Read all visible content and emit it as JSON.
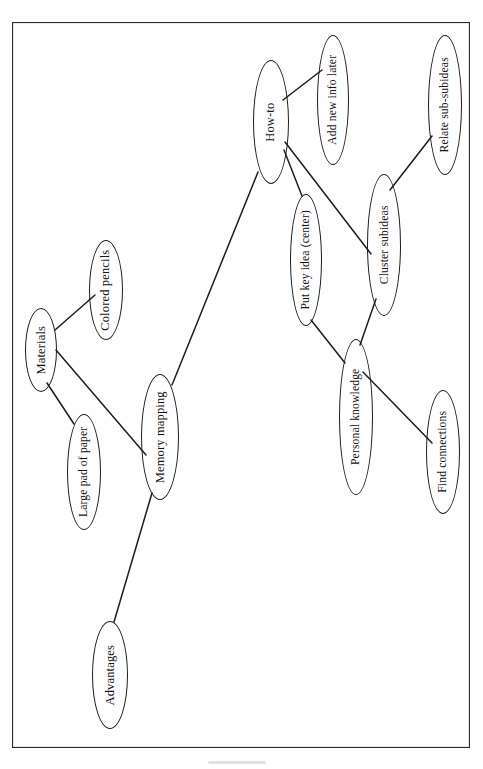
{
  "document": {
    "type": "concept-map",
    "orientation": "rotated-90-ccw",
    "frame_border_color": "#2a2a2a",
    "ink_color": "#1d1d1d",
    "background_color": "#ffffff"
  },
  "diagram": {
    "title": "Memory mapping",
    "root": "Memory mapping",
    "nodes": [
      {
        "id": "memory-mapping",
        "label": "Memory mapping",
        "role": "root",
        "cx": 160,
        "cy": 437,
        "rx": 19,
        "ry": 63
      },
      {
        "id": "materials",
        "label": "Materials",
        "role": "branch",
        "cx": 41,
        "cy": 350,
        "rx": 16,
        "ry": 42
      },
      {
        "id": "colored-pencils",
        "label": "Colored pencils",
        "role": "leaf",
        "cx": 106,
        "cy": 290,
        "rx": 17,
        "ry": 50
      },
      {
        "id": "large-pad-of-paper",
        "label": "Large pad of paper",
        "role": "leaf",
        "cx": 84,
        "cy": 472,
        "rx": 17,
        "ry": 58
      },
      {
        "id": "how-to",
        "label": "How-to",
        "role": "branch",
        "cx": 271,
        "cy": 122,
        "rx": 18,
        "ry": 62
      },
      {
        "id": "add-new-info-later",
        "label": "Add new info later",
        "role": "leaf",
        "cx": 333,
        "cy": 100,
        "rx": 16,
        "ry": 65
      },
      {
        "id": "put-key-idea-center",
        "label": "Put key idea (center)",
        "role": "leaf",
        "cx": 306,
        "cy": 260,
        "rx": 16,
        "ry": 66
      },
      {
        "id": "cluster-subideas",
        "label": "Cluster subideas",
        "role": "branch",
        "cx": 384,
        "cy": 245,
        "rx": 17,
        "ry": 71
      },
      {
        "id": "relate-sub-subideas",
        "label": "Relate sub-subideas",
        "role": "leaf",
        "cx": 445,
        "cy": 105,
        "rx": 17,
        "ry": 70
      },
      {
        "id": "personal-knowledge",
        "label": "Personal knowledge",
        "role": "branch",
        "cx": 356,
        "cy": 417,
        "rx": 17,
        "ry": 78
      },
      {
        "id": "find-connections",
        "label": "Find connections",
        "role": "leaf",
        "cx": 443,
        "cy": 452,
        "rx": 17,
        "ry": 62
      },
      {
        "id": "advantages",
        "label": "Advantages",
        "role": "branch",
        "cx": 110,
        "cy": 675,
        "rx": 18,
        "ry": 54
      }
    ],
    "edges": [
      {
        "id": "edge-materials-colored-pencils",
        "from": "materials",
        "to": "colored-pencils",
        "x1": 55,
        "y1": 330,
        "x2": 95,
        "y2": 295
      },
      {
        "id": "edge-materials-large-pad",
        "from": "materials",
        "to": "large-pad-of-paper",
        "x1": 47,
        "y1": 383,
        "x2": 74,
        "y2": 424
      },
      {
        "id": "edge-materials-memory-mapping",
        "from": "materials",
        "to": "memory-mapping",
        "x1": 56,
        "y1": 350,
        "x2": 146,
        "y2": 455
      },
      {
        "id": "edge-memory-mapping-how-to",
        "from": "memory-mapping",
        "to": "how-to",
        "x1": 172,
        "y1": 385,
        "x2": 258,
        "y2": 172
      },
      {
        "id": "edge-memory-mapping-advantages",
        "from": "memory-mapping",
        "to": "advantages",
        "x1": 152,
        "y1": 493,
        "x2": 114,
        "y2": 622
      },
      {
        "id": "edge-how-to-add-new-info",
        "from": "how-to",
        "to": "add-new-info-later",
        "x1": 283,
        "y1": 100,
        "x2": 322,
        "y2": 70
      },
      {
        "id": "edge-how-to-put-key-idea",
        "from": "how-to",
        "to": "put-key-idea-center",
        "x1": 284,
        "y1": 150,
        "x2": 302,
        "y2": 196
      },
      {
        "id": "edge-how-to-cluster-subideas",
        "from": "how-to",
        "to": "cluster-subideas",
        "x1": 285,
        "y1": 142,
        "x2": 371,
        "y2": 254
      },
      {
        "id": "edge-cluster-relate-sub-subideas",
        "from": "cluster-subideas",
        "to": "relate-sub-subideas",
        "x1": 390,
        "y1": 190,
        "x2": 432,
        "y2": 136
      },
      {
        "id": "edge-cluster-personal-knowledge",
        "from": "cluster-subideas",
        "to": "personal-knowledge",
        "x1": 376,
        "y1": 299,
        "x2": 360,
        "y2": 345
      },
      {
        "id": "edge-put-key-idea-personal-knowledge",
        "from": "put-key-idea-center",
        "to": "personal-knowledge",
        "x1": 311,
        "y1": 320,
        "x2": 345,
        "y2": 363
      },
      {
        "id": "edge-personal-knowledge-find-connections",
        "from": "personal-knowledge",
        "to": "find-connections",
        "x1": 363,
        "y1": 372,
        "x2": 432,
        "y2": 443
      }
    ]
  }
}
